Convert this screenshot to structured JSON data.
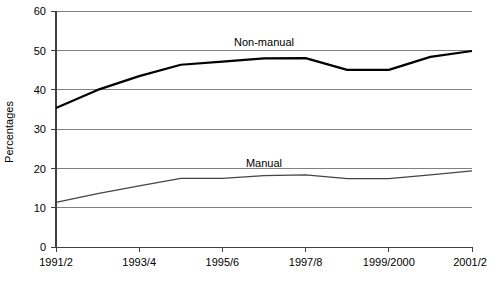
{
  "chart_data": {
    "type": "line",
    "title": "",
    "xlabel": "",
    "ylabel": "Percentages",
    "ylim": [
      0,
      60
    ],
    "yticks": [
      0,
      10,
      20,
      30,
      40,
      50,
      60
    ],
    "ytick_labels": [
      "0",
      "10",
      "20",
      "30",
      "40",
      "50",
      "60"
    ],
    "grid": true,
    "legend_position": "inline-annotation",
    "x": [
      "1991/2",
      "1992/3",
      "1993/4",
      "1994/5",
      "1995/6",
      "1996/7",
      "1997/8",
      "1998/9",
      "1999/2000",
      "2000/1",
      "2001/2"
    ],
    "xtick_labels": [
      "1991/2",
      "1993/4",
      "1995/6",
      "1997/8",
      "1999/2000",
      "2001/2"
    ],
    "xtick_values": [
      "1991/2",
      "1993/4",
      "1995/6",
      "1997/8",
      "1999/2000",
      "2001/2"
    ],
    "series": [
      {
        "name": "Non-manual",
        "values": [
          35.4,
          40.0,
          43.5,
          46.4,
          47.2,
          48.0,
          48.1,
          45.1,
          45.1,
          48.4,
          49.9
        ],
        "color": "#000000",
        "line_width": 2.2,
        "label": "Non-manual",
        "label_x": "1996/7",
        "label_y": 52.2
      },
      {
        "name": "Manual",
        "values": [
          11.4,
          13.6,
          15.6,
          17.5,
          17.5,
          18.2,
          18.4,
          17.4,
          17.4,
          18.4,
          19.4
        ],
        "color": "#444444",
        "line_width": 1.2,
        "label": "Manual",
        "label_x": "1996/7",
        "label_y": 21.3
      }
    ],
    "annotations": [
      {
        "text": "Non-manual",
        "value": 52.2
      },
      {
        "text": "Manual",
        "value": 21.3
      }
    ]
  },
  "axis": {
    "y_title": "Percentages",
    "y_labels": [
      "60",
      "50",
      "40",
      "30",
      "20",
      "10",
      "0"
    ],
    "x_labels": [
      "1991/2",
      "1993/4",
      "1995/6",
      "1997/8",
      "1999/2000",
      "2001/2"
    ]
  },
  "labels": {
    "non_manual": "Non-manual",
    "manual": "Manual"
  },
  "colors": {
    "background": "#ffffff",
    "grid": "#808080",
    "axis": "#404040",
    "non_manual_line": "#000000",
    "manual_line": "#444444",
    "text": "#000000"
  }
}
